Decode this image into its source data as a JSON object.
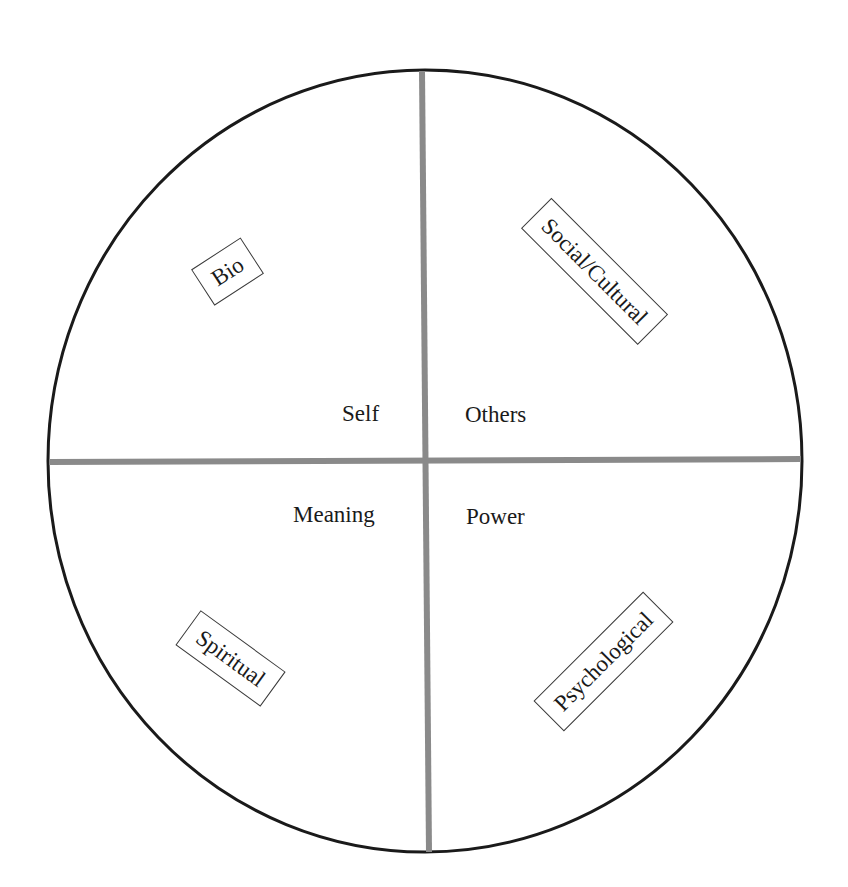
{
  "diagram": {
    "type": "quadrant-circle",
    "colors": {
      "circle_stroke": "#1a1a1a",
      "divider": "#8a8a8a",
      "background": "#ffffff"
    },
    "center_labels": {
      "top_left": "Self",
      "top_right": "Others",
      "bottom_left": "Meaning",
      "bottom_right": "Power"
    },
    "quadrant_tags": {
      "top_left": "Bio",
      "top_right": "Social/Cultural",
      "bottom_left": "Spiritual",
      "bottom_right": "Psychological"
    }
  }
}
